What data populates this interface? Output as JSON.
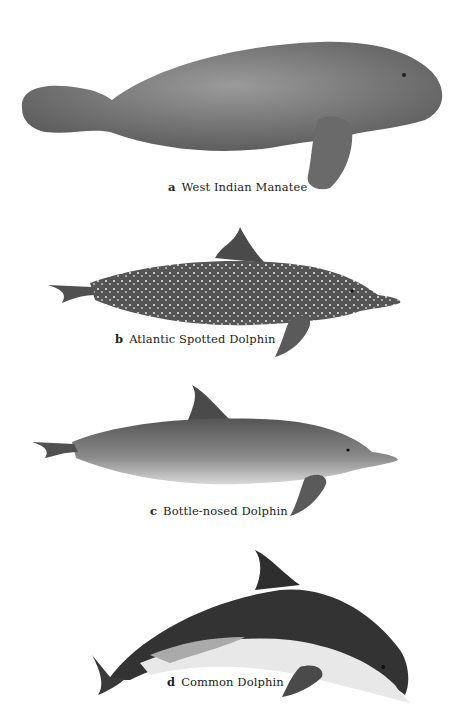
{
  "plate": {
    "figures": [
      {
        "letter": "a",
        "name": "West Indian Manatee",
        "icon": "manatee-illustration"
      },
      {
        "letter": "b",
        "name": "Atlantic Spotted Dolphin",
        "icon": "spotted-dolphin-illustration"
      },
      {
        "letter": "c",
        "name": "Bottle-nosed Dolphin",
        "icon": "bottlenose-dolphin-illustration"
      },
      {
        "letter": "d",
        "name": "Common Dolphin",
        "icon": "common-dolphin-illustration"
      }
    ]
  },
  "colors": {
    "background": "#ffffff",
    "manatee": "#7a7a7a",
    "dolphin_dark": "#3a3a3a",
    "dolphin_mid": "#8a8a8a",
    "belly": "#e6e6e6"
  }
}
